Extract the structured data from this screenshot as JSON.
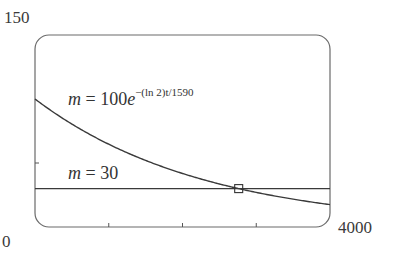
{
  "chart_data": {
    "type": "line",
    "title": "",
    "xlabel": "t",
    "ylabel": "m",
    "xlim": [
      0,
      4000
    ],
    "ylim": [
      0,
      150
    ],
    "x_tick_labels": [
      "0",
      "4000"
    ],
    "y_tick_labels": [
      "150"
    ],
    "x_ticks": [
      1000,
      2000,
      3000
    ],
    "y_ticks": [
      50
    ],
    "grid": false,
    "series": [
      {
        "name": "m = 100e^{-(ln 2)t/1590}",
        "formula": "100*exp(-ln(2)*t/1590)",
        "x": [
          0,
          500,
          1000,
          1500,
          2000,
          2500,
          3000,
          3500,
          4000
        ],
        "values": [
          100,
          80.4,
          64.6,
          52.0,
          41.8,
          33.6,
          27.0,
          21.7,
          17.5
        ]
      },
      {
        "name": "m = 30",
        "x": [
          0,
          4000
        ],
        "values": [
          30,
          30
        ]
      }
    ],
    "annotations": [
      {
        "type": "square-marker",
        "label": "intersection",
        "x": 2762,
        "y": 30
      }
    ]
  },
  "labels": {
    "ymax": "150",
    "xmin": "0",
    "xmax": "4000",
    "eq1_lhs": "m",
    "eq1_mid": " = 100",
    "eq1_base": "e",
    "eq1_exp": "−(ln 2)t/1590",
    "eq2_lhs": "m",
    "eq2_rhs": " = 30"
  }
}
